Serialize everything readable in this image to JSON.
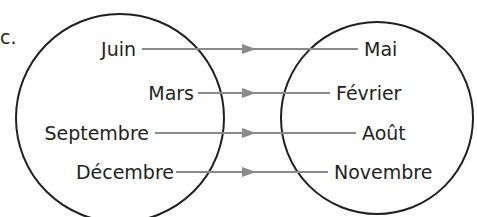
{
  "label": "c.",
  "left_set": {
    "items": [
      "Juin",
      "Mars",
      "Septembre",
      "Décembre"
    ]
  },
  "right_set": {
    "items": [
      "Mai",
      "Février",
      "Août",
      "Novembre"
    ]
  },
  "mapping": [
    {
      "from": "Juin",
      "to": "Mai"
    },
    {
      "from": "Mars",
      "to": "Février"
    },
    {
      "from": "Septembre",
      "to": "Août"
    },
    {
      "from": "Décembre",
      "to": "Novembre"
    }
  ],
  "colors": {
    "circle": "#231f20",
    "arrow": "#8a8a8a",
    "text": "#231f20"
  }
}
